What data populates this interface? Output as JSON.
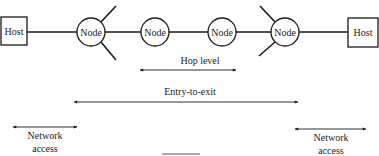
{
  "diagram": {
    "hosts": [
      {
        "id": "host-left",
        "label": "Host",
        "x": 1,
        "y": 17,
        "w": 26,
        "h": 28
      },
      {
        "id": "host-right",
        "label": "Host",
        "x": 348,
        "y": 18,
        "w": 30,
        "h": 29
      }
    ],
    "nodes": [
      {
        "id": "node-1",
        "label": "Node",
        "cx": 91,
        "cy": 32,
        "r": 14
      },
      {
        "id": "node-2",
        "label": "Node",
        "cx": 155,
        "cy": 32,
        "r": 14
      },
      {
        "id": "node-3",
        "label": "Node",
        "cx": 222,
        "cy": 32,
        "r": 14
      },
      {
        "id": "node-4",
        "label": "Node",
        "cx": 285,
        "cy": 32,
        "r": 14
      }
    ],
    "scopes": {
      "hop_level": {
        "label": "Hop level",
        "label_x": 200,
        "label_y": 62,
        "y": 70,
        "x1": 140,
        "x2": 236
      },
      "entry_to_exit": {
        "label": "Entry-to-exit",
        "label_x": 190,
        "label_y": 91,
        "y": 102,
        "x1": 74,
        "x2": 298
      },
      "network_access_left": {
        "line1": "Network",
        "line2": "access",
        "label_x": 45,
        "label_y": 129,
        "y": 127,
        "x1": 13,
        "x2": 77
      },
      "network_access_right": {
        "line1": "Network",
        "line2": "access",
        "label_x": 331,
        "label_y": 131,
        "y": 129,
        "x1": 295,
        "x2": 366
      }
    },
    "colors": {
      "stroke": "#1a1a1a",
      "background": "#ffffff"
    }
  }
}
